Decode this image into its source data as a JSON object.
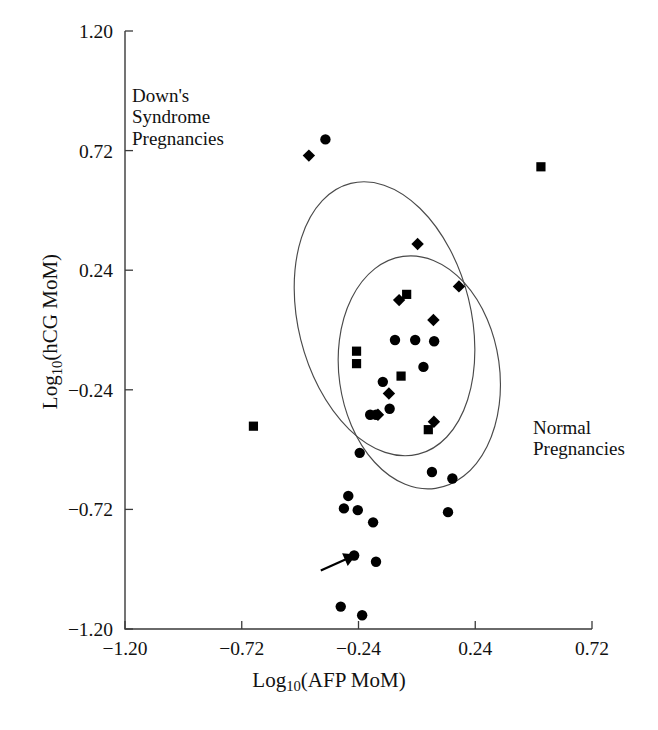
{
  "figure": {
    "xlabel_prefix": "Log",
    "xlabel_sub": "10",
    "xlabel_suffix": "(AFP MoM)",
    "ylabel_prefix": "Log",
    "ylabel_sub": "10",
    "ylabel_suffix": "(hCG MoM)"
  },
  "annotations": {
    "downs_label": "Down's\nSyndrome\nPregnancies",
    "normal_label": "Normal\nPregnancies"
  },
  "chart_data": {
    "type": "scatter",
    "title": "",
    "xlabel": "Log10(AFP MoM)",
    "ylabel": "Log10(hCG MoM)",
    "xlim": [
      -1.2,
      0.72
    ],
    "ylim": [
      -1.2,
      1.2
    ],
    "xticks": [
      "-1.20",
      "-0.72",
      "-0.24",
      "0.24",
      "0.72"
    ],
    "xtick_values": [
      -1.2,
      -0.72,
      -0.24,
      0.24,
      0.72
    ],
    "yticks": [
      "1.20",
      "0.72",
      "0.24",
      "-0.24",
      "-0.72",
      "-1.20"
    ],
    "ytick_values": [
      1.2,
      0.72,
      0.24,
      -0.24,
      -0.72,
      -1.2
    ],
    "grid": false,
    "legend": "none",
    "marker_color": "#000000",
    "ellipse_color": "#4a4a4a",
    "series": [
      {
        "name": "circle-markers",
        "marker": "circle",
        "points": [
          [
            -0.376,
            0.765
          ],
          [
            -0.007,
            -0.04
          ],
          [
            -0.09,
            -0.04
          ],
          [
            0.071,
            -0.045
          ],
          [
            0.027,
            -0.148
          ],
          [
            -0.14,
            -0.208
          ],
          [
            -0.112,
            -0.316
          ],
          [
            -0.192,
            -0.34
          ],
          [
            -0.168,
            -0.34
          ],
          [
            -0.235,
            -0.493
          ],
          [
            0.062,
            -0.57
          ],
          [
            0.146,
            -0.596
          ],
          [
            -0.282,
            -0.666
          ],
          [
            -0.3,
            -0.716
          ],
          [
            -0.243,
            -0.723
          ],
          [
            -0.18,
            -0.772
          ],
          [
            0.128,
            -0.731
          ],
          [
            -0.258,
            -0.905
          ],
          [
            -0.168,
            -0.93
          ],
          [
            -0.313,
            -1.11
          ],
          [
            -0.225,
            -1.145
          ]
        ]
      },
      {
        "name": "diamond-markers",
        "marker": "diamond",
        "points": [
          [
            -0.444,
            0.7
          ],
          [
            0.003,
            0.345
          ],
          [
            0.173,
            0.175
          ],
          [
            -0.073,
            0.12
          ],
          [
            0.068,
            0.04
          ],
          [
            -0.115,
            -0.255
          ],
          [
            -0.16,
            -0.34
          ],
          [
            0.07,
            -0.368
          ]
        ]
      },
      {
        "name": "square-markers",
        "marker": "square",
        "points": [
          [
            0.51,
            0.655
          ],
          [
            -0.042,
            0.143
          ],
          [
            -0.248,
            -0.085
          ],
          [
            -0.248,
            -0.135
          ],
          [
            -0.065,
            -0.185
          ],
          [
            0.047,
            -0.4
          ],
          [
            -0.672,
            -0.386
          ]
        ]
      }
    ],
    "ellipses": [
      {
        "name": "downs-syndrome-ellipse",
        "label": "Down's Syndrome Pregnancies",
        "cx": -0.133,
        "cy": 0.045,
        "rx": 0.355,
        "ry": 0.56,
        "rotation_deg": -14
      },
      {
        "name": "normal-pregnancies-ellipse",
        "label": "Normal Pregnancies",
        "cx": 0.01,
        "cy": -0.17,
        "rx": 0.33,
        "ry": 0.47,
        "rotation_deg": -8
      }
    ],
    "arrow_annotation": {
      "name": "index-case-arrow",
      "points_to": [
        -0.258,
        -0.905
      ],
      "from": [
        -0.395,
        -0.965
      ]
    }
  }
}
